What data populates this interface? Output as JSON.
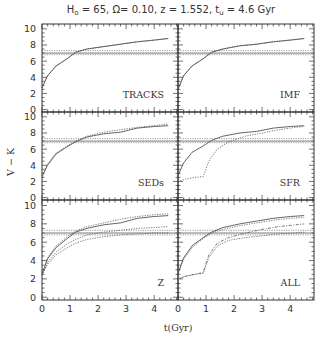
{
  "title_parts": {
    "H0": "65",
    "Omega": "0.10",
    "z": "1.552",
    "tu": "4.6 Gyr"
  },
  "xlabel": "t(Gyr)",
  "ylabel": "V − K",
  "colors": {
    "line": "#555555",
    "frame": "#333333",
    "text": "#333333",
    "bg": "#ffffff"
  },
  "chart_data": {
    "type": "line",
    "xlabel": "t(Gyr)",
    "ylabel": "V - K",
    "xlim": [
      0,
      4.85
    ],
    "ylim": [
      -0.3,
      10.6
    ],
    "xticks": [
      0,
      1,
      2,
      3,
      4
    ],
    "yticks": [
      0,
      2,
      4,
      6,
      8,
      10
    ],
    "grid": false,
    "layout": "3x2 panels, shared axes",
    "reference_band": {
      "solid": 7.0,
      "dotted": [
        6.8,
        7.3
      ]
    },
    "panels": [
      {
        "label": "TRACKS",
        "series": [
          {
            "name": "model A",
            "style": "solid",
            "x": [
              0,
              0.2,
              0.5,
              0.9,
              1.2,
              1.6,
              2.2,
              2.8,
              3.4,
              4.0,
              4.5
            ],
            "y": [
              2.7,
              4.2,
              5.4,
              6.3,
              7.1,
              7.5,
              7.8,
              8.1,
              8.4,
              8.6,
              8.8
            ]
          },
          {
            "name": "model B",
            "style": "dotted",
            "x": [
              0,
              0.2,
              0.5,
              0.9,
              1.2,
              1.6,
              2.2,
              2.8,
              3.4,
              4.0,
              4.5
            ],
            "y": [
              2.7,
              4.2,
              5.4,
              6.3,
              7.1,
              7.5,
              7.8,
              8.1,
              8.4,
              8.6,
              8.8
            ]
          }
        ]
      },
      {
        "label": "IMF",
        "series": [
          {
            "name": "model A",
            "style": "solid",
            "x": [
              0,
              0.2,
              0.5,
              0.9,
              1.2,
              1.6,
              2.2,
              2.8,
              3.4,
              4.0,
              4.5
            ],
            "y": [
              2.5,
              4.2,
              5.4,
              6.3,
              7.1,
              7.5,
              7.9,
              8.1,
              8.4,
              8.6,
              8.8
            ]
          },
          {
            "name": "model B",
            "style": "dotted",
            "x": [
              0,
              0.2,
              0.5,
              0.9,
              1.2,
              1.6,
              2.2,
              2.8,
              3.4,
              4.0,
              4.5
            ],
            "y": [
              2.5,
              4.2,
              5.4,
              6.3,
              7.1,
              7.5,
              7.9,
              8.1,
              8.4,
              8.6,
              8.8
            ]
          }
        ]
      },
      {
        "label": "SEDs",
        "series": [
          {
            "name": "model A",
            "style": "solid",
            "x": [
              0,
              0.2,
              0.5,
              0.9,
              1.2,
              1.6,
              2.2,
              2.8,
              3.4,
              4.0,
              4.5
            ],
            "y": [
              2.6,
              4.0,
              5.4,
              6.3,
              6.9,
              7.5,
              7.9,
              8.1,
              8.6,
              8.8,
              8.9
            ]
          },
          {
            "name": "model B",
            "style": "dotted",
            "x": [
              0,
              0.2,
              0.5,
              0.9,
              1.2,
              1.6,
              2.2,
              2.8,
              3.4,
              4.0,
              4.5
            ],
            "y": [
              2.7,
              4.2,
              5.5,
              6.4,
              7.0,
              7.6,
              8.1,
              8.4,
              8.7,
              8.9,
              9.1
            ]
          }
        ]
      },
      {
        "label": "SFR",
        "series": [
          {
            "name": "model A",
            "style": "solid",
            "x": [
              0,
              0.2,
              0.5,
              0.9,
              1.2,
              1.6,
              2.2,
              2.8,
              3.4,
              4.0,
              4.5
            ],
            "y": [
              2.7,
              4.3,
              5.6,
              6.4,
              7.1,
              7.6,
              8.0,
              8.2,
              8.6,
              8.8,
              8.9
            ]
          },
          {
            "name": "model B",
            "style": "dotted",
            "x": [
              0,
              0.3,
              0.6,
              0.9,
              1.1,
              1.4,
              1.8,
              2.4,
              3.0,
              3.6,
              4.2,
              4.5
            ],
            "y": [
              2.0,
              2.3,
              2.5,
              2.6,
              4.5,
              6.0,
              6.9,
              7.6,
              8.0,
              8.4,
              8.7,
              8.8
            ]
          }
        ]
      },
      {
        "label": "Z",
        "series": [
          {
            "name": "model A",
            "style": "solid",
            "x": [
              0,
              0.2,
              0.5,
              0.9,
              1.2,
              1.6,
              2.2,
              2.8,
              3.4,
              4.0,
              4.5
            ],
            "y": [
              2.5,
              4.2,
              5.4,
              6.4,
              7.1,
              7.5,
              7.9,
              8.1,
              8.6,
              8.8,
              8.9
            ]
          },
          {
            "name": "model B",
            "style": "dotted",
            "x": [
              0,
              0.2,
              0.5,
              0.9,
              1.2,
              1.6,
              2.2,
              2.8,
              3.4,
              4.0,
              4.5
            ],
            "y": [
              2.5,
              4.3,
              5.6,
              6.6,
              7.2,
              7.7,
              8.1,
              8.5,
              8.8,
              9.0,
              9.1
            ]
          },
          {
            "name": "model C",
            "style": "dotted",
            "x": [
              0,
              0.2,
              0.5,
              0.9,
              1.2,
              1.6,
              2.2,
              2.8,
              3.4,
              4.0,
              4.5
            ],
            "y": [
              2.4,
              3.8,
              4.9,
              5.8,
              6.3,
              6.8,
              7.1,
              7.3,
              7.5,
              7.6,
              7.7
            ]
          },
          {
            "name": "model D",
            "style": "dotted",
            "x": [
              0,
              0.2,
              0.5,
              0.9,
              1.2,
              1.6,
              2.2,
              2.8,
              3.4,
              4.0,
              4.5
            ],
            "y": [
              2.4,
              3.6,
              4.6,
              5.4,
              5.9,
              6.3,
              6.6,
              6.8,
              6.9,
              7.0,
              7.0
            ]
          }
        ]
      },
      {
        "label": "ALL",
        "series": [
          {
            "name": "model A",
            "style": "solid",
            "x": [
              0,
              0.2,
              0.5,
              0.9,
              1.2,
              1.6,
              2.2,
              2.8,
              3.4,
              4.0,
              4.5
            ],
            "y": [
              2.6,
              4.3,
              5.6,
              6.5,
              7.1,
              7.6,
              8.0,
              8.3,
              8.6,
              8.8,
              8.9
            ]
          },
          {
            "name": "model B",
            "style": "dotted",
            "x": [
              0,
              0.2,
              0.5,
              0.9,
              1.2,
              1.6,
              2.2,
              2.8,
              3.4,
              4.0,
              4.5
            ],
            "y": [
              2.6,
              4.1,
              5.4,
              6.4,
              7.0,
              7.4,
              7.8,
              8.1,
              8.4,
              8.6,
              8.7
            ]
          },
          {
            "name": "model C",
            "style": "dotted",
            "x": [
              0,
              0.3,
              0.6,
              0.9,
              1.1,
              1.4,
              1.8,
              2.4,
              3.0,
              3.6,
              4.2,
              4.5
            ],
            "y": [
              2.0,
              2.3,
              2.5,
              2.6,
              4.3,
              5.6,
              6.2,
              6.5,
              6.7,
              6.9,
              7.0,
              7.1
            ]
          },
          {
            "name": "model D",
            "style": "dash-dot",
            "x": [
              0,
              0.3,
              0.6,
              0.9,
              1.1,
              1.4,
              1.8,
              2.4,
              3.0,
              3.6,
              4.2,
              4.5
            ],
            "y": [
              2.0,
              2.3,
              2.5,
              2.7,
              4.6,
              5.9,
              6.5,
              7.0,
              7.4,
              7.7,
              7.9,
              8.0
            ]
          }
        ]
      }
    ]
  }
}
